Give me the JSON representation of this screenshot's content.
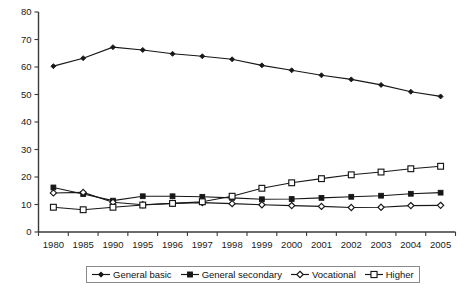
{
  "chart_data": {
    "type": "line",
    "title": "",
    "xlabel": "",
    "ylabel": "",
    "ylim": [
      0,
      80
    ],
    "ytick_step": 10,
    "grid": false,
    "legend_position": "bottom",
    "categories": [
      "1980",
      "1985",
      "1990",
      "1995",
      "1996",
      "1997",
      "1998",
      "1999",
      "2000",
      "2001",
      "2002",
      "2003",
      "2004",
      "2005"
    ],
    "ytick_labels": [
      "0",
      "10",
      "20",
      "30",
      "40",
      "50",
      "60",
      "70",
      "80"
    ],
    "series": [
      {
        "name": "General basic",
        "marker": "filled-diamond",
        "values": [
          60.3,
          63.2,
          67.2,
          66.2,
          64.8,
          63.9,
          62.8,
          60.6,
          58.8,
          57.0,
          55.5,
          53.5,
          51.0,
          49.3
        ]
      },
      {
        "name": "General secondary",
        "marker": "filled-square",
        "values": [
          16.2,
          13.8,
          11.4,
          13.0,
          13.0,
          12.8,
          12.4,
          11.9,
          12.0,
          12.4,
          12.8,
          13.2,
          13.9,
          14.3
        ]
      },
      {
        "name": "Vocational",
        "marker": "open-diamond",
        "values": [
          14.2,
          14.4,
          10.8,
          9.9,
          10.4,
          10.7,
          10.3,
          9.9,
          9.6,
          9.3,
          8.9,
          9.0,
          9.6,
          9.7
        ]
      },
      {
        "name": "Higher",
        "marker": "open-square",
        "values": [
          9.0,
          8.1,
          9.0,
          9.8,
          10.4,
          11.0,
          13.0,
          15.9,
          17.9,
          19.4,
          20.8,
          21.8,
          23.0,
          23.9
        ]
      }
    ]
  },
  "legend": {
    "items": [
      {
        "label": "General basic",
        "marker": "filled-diamond"
      },
      {
        "label": "General secondary",
        "marker": "filled-square"
      },
      {
        "label": "Vocational",
        "marker": "open-diamond"
      },
      {
        "label": "Higher",
        "marker": "open-square"
      }
    ]
  },
  "colors": {
    "series_stroke": "#171717",
    "axis": "#3a3a3a",
    "background": "#ffffff",
    "legend_border": "#8a8a8a"
  }
}
